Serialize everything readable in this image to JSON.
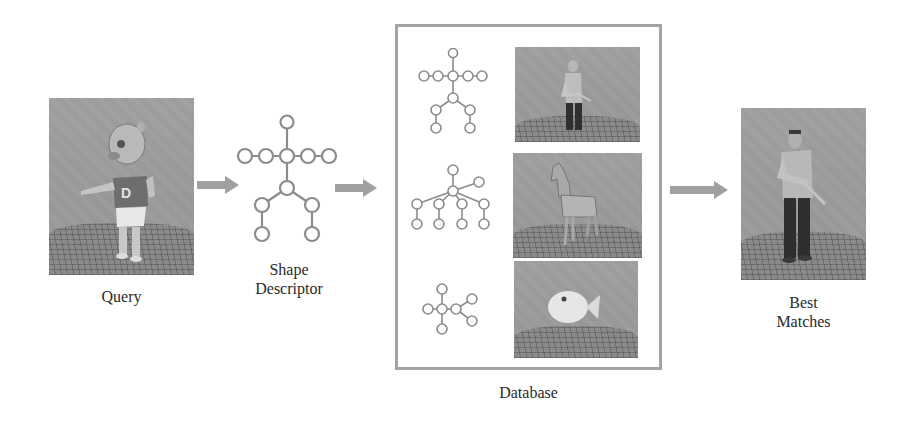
{
  "figure": {
    "stages": [
      {
        "id": "query",
        "label": "Query",
        "image": "3d-cartoon-character-model"
      },
      {
        "id": "descriptor",
        "label": "Shape Descriptor",
        "label_lines": [
          "Shape",
          "Descriptor"
        ],
        "graph": "skeletal-graph-humanoid"
      },
      {
        "id": "database",
        "label": "Database",
        "entries": [
          {
            "graph": "skeletal-graph-humanoid",
            "image": "3d-human-model"
          },
          {
            "graph": "skeletal-graph-quadruped",
            "image": "3d-horse-model"
          },
          {
            "graph": "skeletal-graph-fish",
            "image": "3d-fish-model"
          }
        ]
      },
      {
        "id": "matches",
        "label": "Best Matches",
        "label_lines": [
          "Best",
          "Matches"
        ],
        "image": "3d-human-model"
      }
    ],
    "arrows": [
      "query-to-descriptor",
      "descriptor-to-database",
      "database-to-matches"
    ],
    "colors": {
      "arrow": "#a0a0a0",
      "graph_node": "#8c8c8c",
      "box_border": "#a4a4a4",
      "render_bg": "#9c9c9c",
      "text": "#2a2a2a"
    }
  },
  "labels": {
    "query": "Query",
    "shape": "Shape",
    "descriptor": "Descriptor",
    "database": "Database",
    "best": "Best",
    "matches": "Matches"
  }
}
